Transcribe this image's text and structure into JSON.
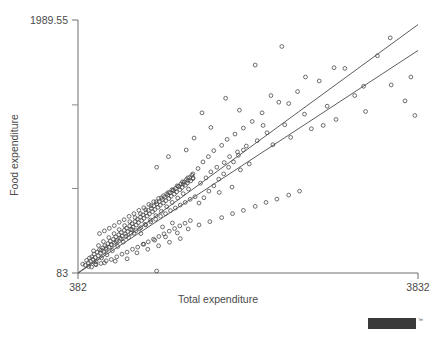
{
  "chart_data": {
    "type": "scatter",
    "title": "",
    "xlabel": "Total expenditure",
    "ylabel": "Food expenditure",
    "xlim": [
      382,
      3832
    ],
    "ylim": [
      83,
      1989.55
    ],
    "xticks": [
      382,
      3832
    ],
    "xtick_labels": [
      "382",
      "3832"
    ],
    "yticks": [
      83,
      1989.55
    ],
    "ytick_labels": [
      "83",
      "1989.55"
    ],
    "y_minor_ticks": [
      720,
      1350
    ],
    "grid": false,
    "legend": null,
    "marker": "open-circle",
    "marker_color": "#4a4a4a",
    "line_color": "#4a4a4a",
    "series": [
      {
        "name": "observations",
        "points": [
          [
            430,
            150
          ],
          [
            455,
            142
          ],
          [
            470,
            178
          ],
          [
            487,
            160
          ],
          [
            498,
            196
          ],
          [
            510,
            171
          ],
          [
            522,
            205
          ],
          [
            533,
            186
          ],
          [
            545,
            225
          ],
          [
            556,
            200
          ],
          [
            566,
            168
          ],
          [
            578,
            240
          ],
          [
            588,
            213
          ],
          [
            600,
            258
          ],
          [
            610,
            232
          ],
          [
            621,
            196
          ],
          [
            632,
            272
          ],
          [
            643,
            246
          ],
          [
            654,
            289
          ],
          [
            665,
            262
          ],
          [
            676,
            220
          ],
          [
            687,
            305
          ],
          [
            698,
            278
          ],
          [
            709,
            322
          ],
          [
            720,
            294
          ],
          [
            731,
            251
          ],
          [
            742,
            338
          ],
          [
            753,
            312
          ],
          [
            764,
            355
          ],
          [
            775,
            328
          ],
          [
            786,
            283
          ],
          [
            797,
            372
          ],
          [
            808,
            346
          ],
          [
            819,
            388
          ],
          [
            830,
            360
          ],
          [
            841,
            316
          ],
          [
            852,
            405
          ],
          [
            863,
            378
          ],
          [
            874,
            421
          ],
          [
            885,
            394
          ],
          [
            896,
            349
          ],
          [
            907,
            438
          ],
          [
            918,
            412
          ],
          [
            929,
            455
          ],
          [
            940,
            428
          ],
          [
            951,
            382
          ],
          [
            962,
            471
          ],
          [
            973,
            445
          ],
          [
            984,
            488
          ],
          [
            995,
            462
          ],
          [
            1006,
            416
          ],
          [
            1017,
            505
          ],
          [
            1028,
            478
          ],
          [
            1039,
            521
          ],
          [
            1050,
            494
          ],
          [
            1062,
            449
          ],
          [
            1073,
            538
          ],
          [
            1084,
            512
          ],
          [
            1095,
            554
          ],
          [
            1106,
            528
          ],
          [
            1117,
            482
          ],
          [
            1128,
            571
          ],
          [
            1139,
            545
          ],
          [
            1150,
            588
          ],
          [
            1161,
            561
          ],
          [
            1172,
            515
          ],
          [
            1183,
            604
          ],
          [
            1194,
            578
          ],
          [
            1205,
            621
          ],
          [
            1216,
            594
          ],
          [
            1228,
            548
          ],
          [
            1239,
            637
          ],
          [
            1250,
            611
          ],
          [
            1261,
            654
          ],
          [
            1272,
            628
          ],
          [
            1283,
            582
          ],
          [
            1294,
            671
          ],
          [
            1305,
            644
          ],
          [
            1316,
            687
          ],
          [
            1327,
            661
          ],
          [
            1338,
            615
          ],
          [
            1349,
            704
          ],
          [
            1360,
            678
          ],
          [
            1371,
            720
          ],
          [
            1382,
            694
          ],
          [
            1394,
            648
          ],
          [
            1405,
            737
          ],
          [
            1416,
            711
          ],
          [
            1427,
            754
          ],
          [
            1438,
            727
          ],
          [
            1449,
            681
          ],
          [
            1460,
            770
          ],
          [
            1471,
            744
          ],
          [
            1482,
            787
          ],
          [
            1493,
            761
          ],
          [
            1504,
            715
          ],
          [
            1515,
            803
          ],
          [
            1526,
            777
          ],
          [
            1537,
            820
          ],
          [
            1548,
            794
          ],
          [
            520,
            128
          ],
          [
            540,
            250
          ],
          [
            565,
            145
          ],
          [
            590,
            290
          ],
          [
            615,
            155
          ],
          [
            640,
            320
          ],
          [
            668,
            175
          ],
          [
            695,
            350
          ],
          [
            720,
            185
          ],
          [
            748,
            380
          ],
          [
            775,
            205
          ],
          [
            800,
            410
          ],
          [
            828,
            225
          ],
          [
            855,
            440
          ],
          [
            880,
            240
          ],
          [
            908,
            470
          ],
          [
            935,
            262
          ],
          [
            962,
            500
          ],
          [
            988,
            278
          ],
          [
            1015,
            530
          ],
          [
            1042,
            300
          ],
          [
            1068,
            560
          ],
          [
            1095,
            318
          ],
          [
            1122,
            590
          ],
          [
            1148,
            338
          ],
          [
            1175,
            620
          ],
          [
            1202,
            358
          ],
          [
            1228,
            650
          ],
          [
            1255,
            378
          ],
          [
            1282,
            680
          ],
          [
            1308,
            398
          ],
          [
            1335,
            710
          ],
          [
            1362,
            418
          ],
          [
            1388,
            740
          ],
          [
            1415,
            438
          ],
          [
            1442,
            770
          ],
          [
            1468,
            458
          ],
          [
            1495,
            800
          ],
          [
            1522,
            478
          ],
          [
            1548,
            830
          ],
          [
            600,
            380
          ],
          [
            650,
            400
          ],
          [
            700,
            420
          ],
          [
            750,
            440
          ],
          [
            800,
            465
          ],
          [
            850,
            485
          ],
          [
            900,
            510
          ],
          [
            950,
            530
          ],
          [
            1000,
            555
          ],
          [
            1050,
            575
          ],
          [
            1100,
            600
          ],
          [
            1150,
            620
          ],
          [
            1200,
            645
          ],
          [
            1250,
            665
          ],
          [
            1300,
            690
          ],
          [
            1350,
            710
          ],
          [
            1400,
            735
          ],
          [
            1450,
            755
          ],
          [
            1500,
            780
          ],
          [
            1550,
            800
          ],
          [
            620,
            255
          ],
          [
            670,
            275
          ],
          [
            720,
            298
          ],
          [
            770,
            318
          ],
          [
            820,
            340
          ],
          [
            870,
            360
          ],
          [
            920,
            382
          ],
          [
            970,
            402
          ],
          [
            1020,
            425
          ],
          [
            1070,
            445
          ],
          [
            1120,
            468
          ],
          [
            1170,
            488
          ],
          [
            1220,
            510
          ],
          [
            1270,
            530
          ],
          [
            1320,
            553
          ],
          [
            1370,
            573
          ],
          [
            1420,
            595
          ],
          [
            1470,
            615
          ],
          [
            1520,
            638
          ],
          [
            1570,
            658
          ],
          [
            1600,
            870
          ],
          [
            1625,
            760
          ],
          [
            1650,
            920
          ],
          [
            1680,
            800
          ],
          [
            1705,
            960
          ],
          [
            1730,
            845
          ],
          [
            1760,
            1005
          ],
          [
            1790,
            880
          ],
          [
            1815,
            690
          ],
          [
            1840,
            1045
          ],
          [
            1865,
            915
          ],
          [
            1895,
            1090
          ],
          [
            1920,
            960
          ],
          [
            1945,
            730
          ],
          [
            1975,
            1130
          ],
          [
            2000,
            995
          ],
          [
            2030,
            860
          ],
          [
            2060,
            1175
          ],
          [
            2090,
            1040
          ],
          [
            2120,
            905
          ],
          [
            1610,
            610
          ],
          [
            1660,
            650
          ],
          [
            1710,
            700
          ],
          [
            1760,
            740
          ],
          [
            1810,
            790
          ],
          [
            1860,
            830
          ],
          [
            1910,
            880
          ],
          [
            1960,
            920
          ],
          [
            2010,
            970
          ],
          [
            2060,
            1010
          ],
          [
            2150,
            1225
          ],
          [
            2200,
            1080
          ],
          [
            2250,
            1290
          ],
          [
            2300,
            1140
          ],
          [
            2360,
            1050
          ],
          [
            2420,
            1370
          ],
          [
            2480,
            1200
          ],
          [
            2540,
            1105
          ],
          [
            2610,
            1450
          ],
          [
            2680,
            1280
          ],
          [
            2750,
            1170
          ],
          [
            2830,
            1530
          ],
          [
            2910,
            1340
          ],
          [
            3000,
            1240
          ],
          [
            3090,
            1625
          ],
          [
            3190,
            1420
          ],
          [
            3300,
            1300
          ],
          [
            3420,
            1720
          ],
          [
            3560,
            1500
          ],
          [
            3700,
            1380
          ],
          [
            2180,
            1650
          ],
          [
            2450,
            1790
          ],
          [
            2690,
            1560
          ],
          [
            2980,
            1630
          ],
          [
            3280,
            1490
          ],
          [
            3550,
            1855
          ],
          [
            3760,
            1560
          ],
          [
            3800,
            1270
          ],
          [
            2340,
            1420
          ],
          [
            2870,
            1195
          ],
          [
            1640,
            1290
          ],
          [
            1880,
            1400
          ],
          [
            2020,
            1310
          ],
          [
            2260,
            1195
          ],
          [
            2520,
            1360
          ],
          [
            1730,
            1180
          ],
          [
            1560,
            1100
          ],
          [
            1480,
            1010
          ],
          [
            1300,
            960
          ],
          [
            1180,
            880
          ],
          [
            1050,
            300
          ],
          [
            1160,
            330
          ],
          [
            1270,
            355
          ],
          [
            1390,
            385
          ],
          [
            1500,
            415
          ],
          [
            1610,
            445
          ],
          [
            1720,
            470
          ],
          [
            1840,
            500
          ],
          [
            1950,
            530
          ],
          [
            2060,
            555
          ],
          [
            2180,
            585
          ],
          [
            2290,
            615
          ],
          [
            2400,
            640
          ],
          [
            2520,
            670
          ],
          [
            2630,
            700
          ],
          [
            980,
            235
          ],
          [
            1090,
            262
          ],
          [
            1200,
            288
          ],
          [
            1310,
            315
          ],
          [
            1420,
            342
          ],
          [
            880,
            190
          ],
          [
            760,
            172
          ],
          [
            650,
            160
          ],
          [
            560,
            150
          ],
          [
            490,
            132
          ],
          [
            1180,
            98
          ],
          [
            930,
            410
          ],
          [
            1020,
            380
          ],
          [
            1240,
            430
          ],
          [
            1340,
            460
          ]
        ]
      }
    ],
    "fit_lines": [
      {
        "name": "upper-fit-line",
        "x1": 382,
        "y1": 83,
        "x2": 3832,
        "y2": 1955
      },
      {
        "name": "lower-fit-line",
        "x1": 382,
        "y1": 83,
        "x2": 3832,
        "y2": 1760
      }
    ]
  },
  "logo": {
    "text": "stata",
    "trademark": "™"
  }
}
